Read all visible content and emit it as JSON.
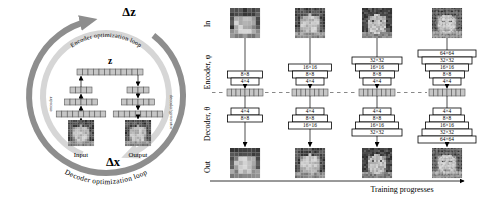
{
  "left_panel": {
    "delta_z_label": "Δz",
    "encoder_loop_label": "Encoder optimization loop",
    "latent_label": "z",
    "encoder_axis_label": "encoder",
    "decoder_axis_label": "decoder/generator",
    "input_label": "Input",
    "output_label": "Output",
    "delta_x_label": "Δx",
    "decoder_loop_label": "Decoder optimization loop",
    "latent_cells": 12,
    "stack_row_cells": [
      4,
      6,
      9
    ],
    "input_face": "pixelated grayscale face photo",
    "output_face": "pixelated grayscale face photo"
  },
  "right_panel": {
    "row_labels": {
      "in": "In",
      "encoder": "Encoder, φ",
      "decoder": "Decoder, θ",
      "out": "Out"
    },
    "columns": [
      {
        "encoder_stack": [
          "8×8",
          "4×4"
        ],
        "decoder_stack": [
          "4×4",
          "8×8"
        ]
      },
      {
        "encoder_stack": [
          "16×16",
          "8×8",
          "4×4"
        ],
        "decoder_stack": [
          "4×4",
          "8×8",
          "16×16"
        ]
      },
      {
        "encoder_stack": [
          "32×32",
          "16×16",
          "8×8",
          "4×4"
        ],
        "decoder_stack": [
          "4×4",
          "8×8",
          "16×16",
          "32×32"
        ]
      },
      {
        "encoder_stack": [
          "64×64",
          "32×32",
          "16×16",
          "8×8",
          "4×4"
        ],
        "decoder_stack": [
          "4×4",
          "8×8",
          "16×16",
          "32×32",
          "64×64"
        ]
      }
    ],
    "latent_cells": 8,
    "axis_label": "Training progresses",
    "in_faces": "grayscale face photos shown at increasing resolution",
    "out_faces": "grayscale face reconstructions at increasing resolution"
  },
  "colors": {
    "outer_ring": "#8e8e8e",
    "inner_ring": "#d6d6d6",
    "cell_fill": "#c6c6c6",
    "cell_border": "#555555",
    "box_fill": "#ffffff",
    "box_border": "#000000",
    "text": "#000000",
    "dash": "#888888"
  }
}
